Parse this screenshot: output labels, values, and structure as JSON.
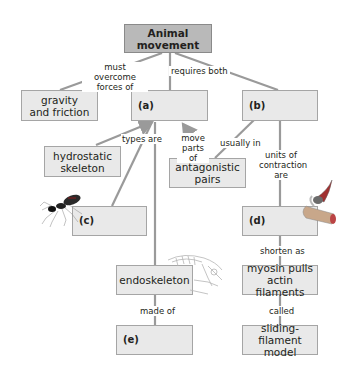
{
  "diagram": {
    "type": "concept-map",
    "root": {
      "label": "Animal movement"
    },
    "nodes": {
      "gravity": {
        "label": "gravity\nand friction"
      },
      "a": {
        "label": "(a)"
      },
      "b": {
        "label": "(b)"
      },
      "hydrostatic": {
        "label": "hydrostatic\nskeleton"
      },
      "antagonistic": {
        "label": "antagonistic\npairs"
      },
      "c": {
        "label": "(c)"
      },
      "d": {
        "label": "(d)"
      },
      "endoskeleton": {
        "label": "endoskeleton"
      },
      "myosin": {
        "label": "myosin pulls\nactin filaments"
      },
      "e": {
        "label": "(e)"
      },
      "sliding": {
        "label": "sliding-filament\nmodel"
      }
    },
    "links": {
      "must_overcome": "must overcome\nforces of",
      "requires_both": "requires both",
      "types_are": "types are",
      "move_parts_of": "move\nparts of",
      "usually_in": "usually in",
      "units_of_contraction": "units of\ncontraction\nare",
      "shorten_as": "shorten as",
      "made_of": "made of",
      "called": "called"
    },
    "illustrations": {
      "ant": "ant-illustration",
      "muscle_fiber": "muscle-fiber-illustration",
      "skeleton": "vertebrate-skeleton-illustration"
    },
    "colors": {
      "root_fill": "#b9b9b9",
      "box_fill": "#e9e9e9",
      "border": "#a5a5a5",
      "line": "#9a9a9a",
      "text": "#231f20"
    }
  }
}
